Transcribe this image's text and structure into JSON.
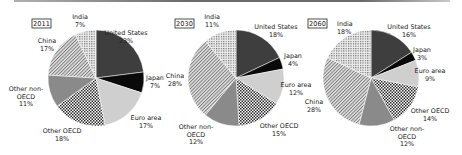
{
  "chart_data": [
    {
      "type": "pie",
      "title": "2011",
      "center": [
        96,
        78
      ],
      "radius": 48,
      "start_angle_deg": 0,
      "slices": [
        {
          "label": "United States",
          "value": 23,
          "display": "23%",
          "fill": "us"
        },
        {
          "label": "Japan",
          "value": 7,
          "display": "7%",
          "fill": "japan"
        },
        {
          "label": "Euro area",
          "value": 17,
          "display": "17%",
          "fill": "euro"
        },
        {
          "label": "Other OECD",
          "value": 18,
          "display": "18%",
          "fill": "otheroecd"
        },
        {
          "label": "Other non-OECD",
          "value": 11,
          "display": "11%",
          "fill": "nonoecd"
        },
        {
          "label": "China",
          "value": 17,
          "display": "17%",
          "fill": "china"
        },
        {
          "label": "India",
          "value": 7,
          "display": "7%",
          "fill": "india"
        }
      ],
      "year_box": {
        "x": 32,
        "y": 19,
        "w": 19,
        "h": 9
      },
      "labels": [
        {
          "lines": [
            "United States",
            "23%"
          ],
          "x": 126,
          "y": 35,
          "anchor": "middle"
        },
        {
          "lines": [
            "Japan",
            "7%"
          ],
          "x": 155,
          "y": 80,
          "anchor": "middle"
        },
        {
          "lines": [
            "Euro area",
            "17%"
          ],
          "x": 146,
          "y": 120,
          "anchor": "middle"
        },
        {
          "lines": [
            "Other OECD",
            "18%"
          ],
          "x": 62,
          "y": 133,
          "anchor": "middle"
        },
        {
          "lines": [
            "Other non-",
            "OECD",
            "11%"
          ],
          "x": 26,
          "y": 91,
          "anchor": "middle"
        },
        {
          "lines": [
            "China",
            "17%"
          ],
          "x": 47,
          "y": 43,
          "anchor": "middle"
        },
        {
          "lines": [
            "India",
            "7%"
          ],
          "x": 80,
          "y": 19,
          "anchor": "middle"
        }
      ]
    },
    {
      "type": "pie",
      "title": "2030",
      "center": [
        236,
        78
      ],
      "radius": 48,
      "start_angle_deg": 0,
      "slices": [
        {
          "label": "United States",
          "value": 18,
          "display": "18%",
          "fill": "us"
        },
        {
          "label": "Japan",
          "value": 4,
          "display": "4%",
          "fill": "japan"
        },
        {
          "label": "Euro area",
          "value": 12,
          "display": "12%",
          "fill": "euro"
        },
        {
          "label": "Other OECD",
          "value": 15,
          "display": "15%",
          "fill": "otheroecd"
        },
        {
          "label": "Other non-OECD",
          "value": 12,
          "display": "12%",
          "fill": "nonoecd"
        },
        {
          "label": "China",
          "value": 28,
          "display": "28%",
          "fill": "china"
        },
        {
          "label": "India",
          "value": 11,
          "display": "11%",
          "fill": "india"
        }
      ],
      "year_box": {
        "x": 175,
        "y": 19,
        "w": 19,
        "h": 9
      },
      "labels": [
        {
          "lines": [
            "United States",
            "18%"
          ],
          "x": 276,
          "y": 29,
          "anchor": "middle"
        },
        {
          "lines": [
            "Japan",
            "4%"
          ],
          "x": 293,
          "y": 58,
          "anchor": "middle"
        },
        {
          "lines": [
            "Euro area",
            "12%"
          ],
          "x": 296,
          "y": 87,
          "anchor": "middle"
        },
        {
          "lines": [
            "Other OECD",
            "15%"
          ],
          "x": 279,
          "y": 128,
          "anchor": "middle"
        },
        {
          "lines": [
            "Other non-",
            "OECD",
            "12%"
          ],
          "x": 196,
          "y": 129,
          "anchor": "middle"
        },
        {
          "lines": [
            "China",
            "28%"
          ],
          "x": 175,
          "y": 78,
          "anchor": "middle"
        },
        {
          "lines": [
            "India",
            "11%"
          ],
          "x": 212,
          "y": 19,
          "anchor": "middle"
        }
      ]
    },
    {
      "type": "pie",
      "title": "2060",
      "center": [
        371,
        78
      ],
      "radius": 48,
      "start_angle_deg": 0,
      "slices": [
        {
          "label": "United States",
          "value": 16,
          "display": "16%",
          "fill": "us"
        },
        {
          "label": "Japan",
          "value": 3,
          "display": "3%",
          "fill": "japan"
        },
        {
          "label": "Euro area",
          "value": 9,
          "display": "9%",
          "fill": "euro"
        },
        {
          "label": "Other OECD",
          "value": 14,
          "display": "14%",
          "fill": "otheroecd"
        },
        {
          "label": "Other non-OECD",
          "value": 12,
          "display": "12%",
          "fill": "nonoecd"
        },
        {
          "label": "China",
          "value": 28,
          "display": "28%",
          "fill": "china"
        },
        {
          "label": "India",
          "value": 18,
          "display": "18%",
          "fill": "india"
        }
      ],
      "year_box": {
        "x": 308,
        "y": 19,
        "w": 19,
        "h": 9
      },
      "labels": [
        {
          "lines": [
            "United States",
            "16%"
          ],
          "x": 409,
          "y": 29,
          "anchor": "middle"
        },
        {
          "lines": [
            "Japan",
            "3%"
          ],
          "x": 422,
          "y": 52,
          "anchor": "middle"
        },
        {
          "lines": [
            "Euro area",
            "9%"
          ],
          "x": 430,
          "y": 73,
          "anchor": "middle"
        },
        {
          "lines": [
            "Other OECD",
            "14%"
          ],
          "x": 430,
          "y": 113,
          "anchor": "middle"
        },
        {
          "lines": [
            "Other non-",
            "OECD",
            "12%"
          ],
          "x": 407,
          "y": 131,
          "anchor": "middle"
        },
        {
          "lines": [
            "China",
            "28%"
          ],
          "x": 314,
          "y": 104,
          "anchor": "middle"
        },
        {
          "lines": [
            "India",
            "18%"
          ],
          "x": 337,
          "y": 26,
          "anchor": "start"
        }
      ]
    }
  ],
  "fills": {
    "us": "#3e3e3e",
    "japan": "#0a0a0a",
    "euro": "#cfcfcf",
    "otheroecd": "pattern-checker",
    "nonoecd": "#8a8a8a",
    "china": "pattern-diagonal",
    "india": "pattern-grid"
  }
}
